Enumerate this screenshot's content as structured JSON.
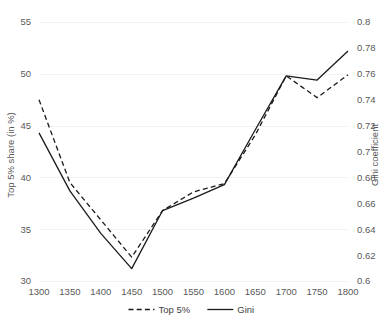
{
  "chart_data": {
    "type": "line",
    "title": "",
    "xlabel": "",
    "ylabel": "Top 5% share (in %)",
    "y2label": "Gini coefficient",
    "x": [
      1300,
      1350,
      1400,
      1450,
      1500,
      1550,
      1600,
      1650,
      1700,
      1750,
      1800
    ],
    "categories": [
      "1300",
      "1350",
      "1400",
      "1450",
      "1500",
      "1550",
      "1600",
      "1650",
      "1700",
      "1750",
      "1800"
    ],
    "series": [
      {
        "name": "Top 5%",
        "axis": "left",
        "style": "dashed",
        "values": [
          47.5,
          39.5,
          35.9,
          32.3,
          36.8,
          38.6,
          39.4,
          44.1,
          49.8,
          47.7,
          49.9
        ]
      },
      {
        "name": "Gini",
        "axis": "right",
        "style": "solid",
        "values": [
          0.714,
          0.672,
          0.641,
          0.609,
          0.653,
          0.662,
          0.672,
          0.723,
          0.76,
          0.755,
          0.777
        ],
        "values_left_scale": [
          44.3,
          38.7,
          34.6,
          31.2,
          36.8,
          38.0,
          39.3,
          44.6,
          49.8,
          49.4,
          52.2
        ]
      }
    ],
    "ylim": [
      30,
      55
    ],
    "yticks": [
      30,
      35,
      40,
      45,
      50,
      55
    ],
    "ytick_labels": [
      "30",
      "35",
      "40",
      "45",
      "50",
      "55"
    ],
    "y2lim": [
      0.6,
      0.8
    ],
    "y2ticks": [
      0.6,
      0.62,
      0.64,
      0.66,
      0.68,
      0.7,
      0.72,
      0.74,
      0.76,
      0.78,
      0.8
    ],
    "y2tick_labels": [
      "0.6",
      "0.62",
      "0.64",
      "0.66",
      "0.68",
      "0.7",
      "0.72",
      "0.74",
      "0.76",
      "0.78",
      "0.8"
    ],
    "xlim": [
      1300,
      1800
    ],
    "grid": true,
    "grid_axis": "y",
    "legend_position": "bottom",
    "legend": [
      {
        "label": "Top 5%",
        "style": "dashed"
      },
      {
        "label": "Gini",
        "style": "solid"
      }
    ],
    "colors": {
      "line": "#1a1a1a",
      "grid": "#f2f2f2",
      "text": "#595959",
      "background": "#ffffff"
    }
  }
}
